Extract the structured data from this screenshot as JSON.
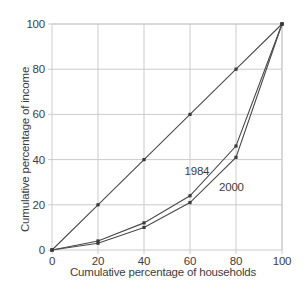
{
  "chart_data": {
    "type": "line",
    "title": "",
    "xlabel": "Cumulative percentage of households",
    "ylabel": "Cumulative percentage of income",
    "x": [
      0,
      20,
      40,
      60,
      80,
      100
    ],
    "xticks": [
      0,
      20,
      40,
      60,
      80,
      100
    ],
    "yticks": [
      0,
      20,
      40,
      60,
      80,
      100
    ],
    "xlim": [
      0,
      100
    ],
    "ylim": [
      0,
      100
    ],
    "grid": true,
    "legend_position": "inline-annotations",
    "series": [
      {
        "name": "line-of-equality",
        "label": "",
        "values": [
          0,
          20,
          40,
          60,
          80,
          100
        ],
        "color": "#4a4a4a"
      },
      {
        "name": "lorenz-1984",
        "label": "1984",
        "values": [
          0,
          4,
          12,
          24,
          46,
          100
        ],
        "color": "#4a4a4a",
        "annotation": {
          "text": "1984",
          "x_data": 63,
          "y_data": 35
        }
      },
      {
        "name": "lorenz-2000",
        "label": "2000",
        "values": [
          0,
          3,
          10,
          21,
          41,
          100
        ],
        "color": "#4a4a4a",
        "annotation": {
          "text": "2000",
          "x_data": 78,
          "y_data": 28
        }
      }
    ],
    "colors": {
      "background": "#ffffff",
      "grid": "#cbcbcb",
      "frame": "#cbcbcb",
      "tick": "#cbcbcb",
      "text": "#3d3d3d",
      "line": "#4a4a4a",
      "marker": "#3a3a3a"
    }
  }
}
